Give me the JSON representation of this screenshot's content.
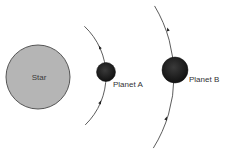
{
  "diagram": {
    "title": "",
    "star": {
      "label": "Star",
      "cx": 38,
      "cy": 77,
      "r": 32,
      "fill": "#b5b5b5",
      "stroke": "#555555"
    },
    "planets": [
      {
        "label": "Planet A",
        "cx": 106,
        "cy": 72,
        "r": 9.5,
        "fill": "#1e1e1e",
        "label_x": 113,
        "label_y": 81,
        "orbit": {
          "cx": 38,
          "cy": 76,
          "r": 68,
          "start_deg": -47,
          "end_deg": 46
        },
        "arrows": [
          {
            "x": 100,
            "y": 48
          },
          {
            "x": 100,
            "y": 103
          }
        ]
      },
      {
        "label": "Planet B",
        "cx": 175,
        "cy": 70,
        "r": 13,
        "fill": "#1e1e1e",
        "label_x": 189,
        "label_y": 76,
        "orbit": {
          "cx": 38,
          "cy": 76,
          "r": 136,
          "start_deg": -31,
          "end_deg": 32
        },
        "arrows": [
          {
            "x": 168,
            "y": 30
          },
          {
            "x": 166,
            "y": 119
          }
        ]
      }
    ],
    "orbit_color": "#4a4a4a",
    "motion_direction": "counterclockwise"
  }
}
